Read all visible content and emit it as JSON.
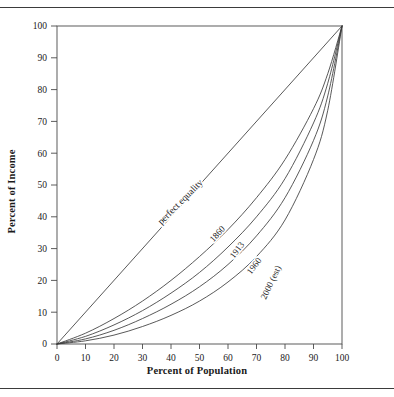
{
  "figure": {
    "has_top_rule": true,
    "has_bottom_rule": true,
    "line_color": "#3b3b3b",
    "text_color": "#1a1a1a",
    "frame_color": "#4a4a4a"
  },
  "chart_data": {
    "type": "line",
    "title": "",
    "xlabel": "Percent of Population",
    "ylabel": "Percent of Income",
    "xlim": [
      0,
      100
    ],
    "ylim": [
      0,
      100
    ],
    "xticks": [
      0,
      10,
      20,
      30,
      40,
      50,
      60,
      70,
      80,
      90,
      100
    ],
    "yticks": [
      0,
      10,
      20,
      30,
      40,
      50,
      60,
      70,
      80,
      90,
      100
    ],
    "xticklabels": [
      "0",
      "10",
      "20",
      "30",
      "40",
      "50",
      "60",
      "70",
      "80",
      "90",
      "100"
    ],
    "yticklabels": [
      "0",
      "10",
      "20",
      "30",
      "40",
      "50",
      "60",
      "70",
      "80",
      "90",
      "100"
    ],
    "grid": false,
    "legend": "inline-curve-labels",
    "x": [
      0,
      10,
      20,
      30,
      40,
      50,
      60,
      70,
      80,
      90,
      95,
      100
    ],
    "series": [
      {
        "name": "perfect equality",
        "label": "perfect equality",
        "label_x": 44,
        "label_y": 44,
        "values": [
          0,
          10,
          20,
          30,
          40,
          50,
          60,
          70,
          80,
          90,
          95,
          100
        ]
      },
      {
        "name": "1860",
        "label": "1860",
        "label_x": 57,
        "label_y": 34,
        "values": [
          0,
          3.4,
          8.0,
          13.5,
          20.0,
          27.5,
          36.0,
          46.0,
          58.0,
          74.0,
          85.0,
          100
        ]
      },
      {
        "name": "1913",
        "label": "1913",
        "label_x": 64,
        "label_y": 29,
        "values": [
          0,
          2.4,
          6.0,
          10.5,
          16.0,
          22.5,
          30.5,
          40.0,
          52.0,
          69.5,
          82.0,
          100
        ]
      },
      {
        "name": "1960",
        "label": "1960",
        "label_x": 70,
        "label_y": 24,
        "values": [
          0,
          1.6,
          4.3,
          8.0,
          12.5,
          18.0,
          25.0,
          34.0,
          46.0,
          64.0,
          78.0,
          100
        ]
      },
      {
        "name": "2000 (est)",
        "label": "2000 (est)",
        "label_x": 76,
        "label_y": 19,
        "values": [
          0,
          1.0,
          2.8,
          5.5,
          9.0,
          13.5,
          19.5,
          27.5,
          39.0,
          58.0,
          73.5,
          100
        ]
      }
    ]
  }
}
